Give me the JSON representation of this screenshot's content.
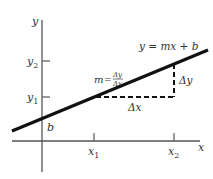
{
  "diagram": {
    "axes": {
      "x_label": "x",
      "y_label": "y"
    },
    "ticks": {
      "x1": "x",
      "x1_sub": "1",
      "x2": "x",
      "x2_sub": "2",
      "y1": "y",
      "y1_sub": "1",
      "y2": "y",
      "y2_sub": "2"
    },
    "line_equation": "y = mx + b",
    "intercept_label": "b",
    "slope": {
      "m": "m",
      "equals": "=",
      "numerator": "Δy",
      "denominator": "Δx"
    },
    "delta_x_label": "Δx",
    "delta_y_label": "Δy",
    "colors": {
      "line": "#111111",
      "axes": "#555555",
      "text": "#333333",
      "background": "#ffffff"
    }
  }
}
